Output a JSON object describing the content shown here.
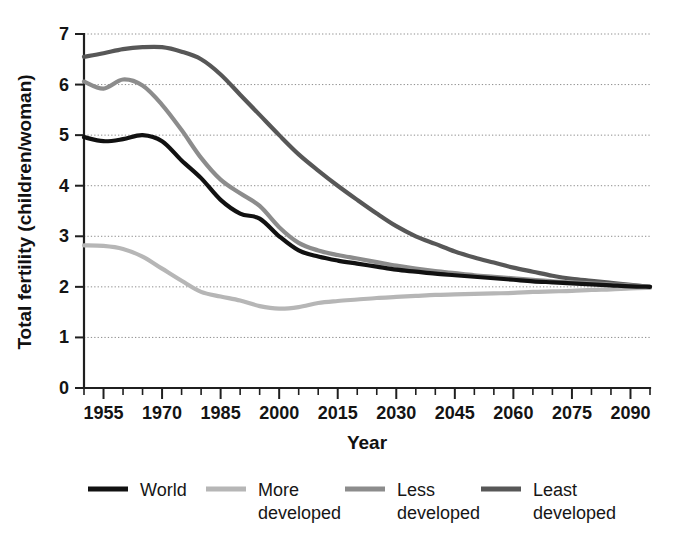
{
  "chart_data": {
    "type": "line",
    "title": "",
    "xlabel": "Year",
    "ylabel": "Total fertility (children/woman)",
    "xlim": [
      1950,
      2095
    ],
    "ylim": [
      0,
      7
    ],
    "grid": true,
    "grid_axis": "y",
    "legend_position": "bottom",
    "x_major_ticks": [
      1955,
      1970,
      1985,
      2000,
      2015,
      2030,
      2045,
      2060,
      2075,
      2090
    ],
    "x_minor_tick_step": 5,
    "x_tick_labels": [
      "1955",
      "1970",
      "1985",
      "2000",
      "2015",
      "2030",
      "2045",
      "2060",
      "2075",
      "2090"
    ],
    "y_ticks": [
      0,
      1,
      2,
      3,
      4,
      5,
      6,
      7
    ],
    "y_tick_labels": [
      "0",
      "1",
      "2",
      "3",
      "4",
      "5",
      "6",
      "7"
    ],
    "x": [
      1950,
      1955,
      1960,
      1965,
      1970,
      1975,
      1980,
      1985,
      1990,
      1995,
      2000,
      2005,
      2010,
      2015,
      2020,
      2025,
      2030,
      2035,
      2040,
      2045,
      2050,
      2055,
      2060,
      2065,
      2070,
      2075,
      2080,
      2085,
      2090,
      2095
    ],
    "series": [
      {
        "name": "World",
        "color": "#111111",
        "width": 4.2,
        "values": [
          4.96,
          4.88,
          4.92,
          5.0,
          4.88,
          4.5,
          4.15,
          3.72,
          3.45,
          3.35,
          3.0,
          2.72,
          2.6,
          2.52,
          2.46,
          2.4,
          2.34,
          2.3,
          2.26,
          2.23,
          2.2,
          2.17,
          2.14,
          2.11,
          2.09,
          2.07,
          2.05,
          2.03,
          2.01,
          2.0
        ]
      },
      {
        "name": "More developed",
        "color": "#b6b6b6",
        "width": 4.2,
        "values": [
          2.82,
          2.81,
          2.75,
          2.6,
          2.36,
          2.12,
          1.9,
          1.81,
          1.73,
          1.62,
          1.57,
          1.6,
          1.68,
          1.72,
          1.75,
          1.78,
          1.8,
          1.82,
          1.84,
          1.85,
          1.86,
          1.87,
          1.88,
          1.9,
          1.91,
          1.92,
          1.94,
          1.95,
          1.97,
          1.98
        ]
      },
      {
        "name": "Less developed",
        "color": "#8c8c8c",
        "width": 4.2,
        "values": [
          6.06,
          5.92,
          6.1,
          5.98,
          5.6,
          5.1,
          4.55,
          4.12,
          3.85,
          3.6,
          3.18,
          2.87,
          2.72,
          2.63,
          2.56,
          2.49,
          2.42,
          2.36,
          2.31,
          2.27,
          2.23,
          2.2,
          2.17,
          2.14,
          2.11,
          2.09,
          2.07,
          2.05,
          2.03,
          2.0
        ]
      },
      {
        "name": "Least developed",
        "color": "#575757",
        "width": 4.2,
        "values": [
          6.55,
          6.62,
          6.7,
          6.74,
          6.74,
          6.65,
          6.5,
          6.2,
          5.8,
          5.4,
          5.0,
          4.62,
          4.3,
          4.0,
          3.72,
          3.45,
          3.2,
          3.0,
          2.85,
          2.7,
          2.58,
          2.48,
          2.38,
          2.3,
          2.22,
          2.16,
          2.12,
          2.08,
          2.04,
          2.0
        ]
      }
    ],
    "legend": [
      {
        "label_line1": "World",
        "label_line2": "",
        "color": "#111111"
      },
      {
        "label_line1": "More",
        "label_line2": "developed",
        "color": "#b6b6b6"
      },
      {
        "label_line1": "Less",
        "label_line2": "developed",
        "color": "#8c8c8c"
      },
      {
        "label_line1": "Least",
        "label_line2": "developed",
        "color": "#575757"
      }
    ]
  }
}
